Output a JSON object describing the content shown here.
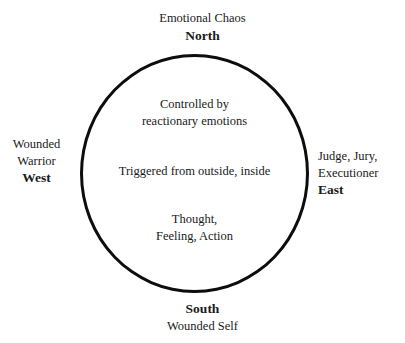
{
  "diagram": {
    "shape": "circle",
    "stroke_color": "#0d0d0d",
    "background_color": "#ffffff",
    "text_color": "#1a1a1a",
    "outer_labels": {
      "north": {
        "descriptor": "Emotional Chaos",
        "direction": "North"
      },
      "east": {
        "descriptor_line1": "Judge, Jury,",
        "descriptor_line2": "Executioner",
        "direction": "East"
      },
      "south": {
        "direction": "South",
        "descriptor": "Wounded Self"
      },
      "west": {
        "descriptor_line1": "Wounded",
        "descriptor_line2": "Warrior",
        "direction": "West"
      }
    },
    "inner_text": {
      "top_line1": "Controlled by",
      "top_line2": "reactionary emotions",
      "middle_line1": "Triggered from outside, inside",
      "bottom_line1": "Thought,",
      "bottom_line2": "Feeling, Action"
    }
  }
}
